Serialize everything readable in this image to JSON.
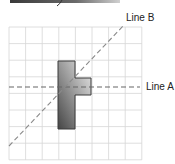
{
  "diagram": {
    "type": "grid-reflection",
    "grid": {
      "columns": 8,
      "rows": 8,
      "origin_px": [
        9,
        27
      ],
      "cell_px": 16.6,
      "line_color": "#d4d4d4"
    },
    "shape": {
      "description": "T-shaped figure (vertical bar with arm to the right)",
      "cells": [
        [
          3,
          2
        ],
        [
          3,
          3
        ],
        [
          4,
          3
        ],
        [
          3,
          4
        ],
        [
          3,
          5
        ],
        [
          3,
          6
        ]
      ],
      "fill_light": "#e8e8e8",
      "fill_dark": "#4a4a4a",
      "stroke": "#333333"
    },
    "lines": [
      {
        "id": "A",
        "label": "Line A",
        "kind": "horizontal dashed",
        "color": "#666666"
      },
      {
        "id": "B",
        "label": "Line B",
        "kind": "diagonal dashed",
        "color": "#888888"
      }
    ],
    "top_fragment": "cut-off gradient bar at top edge"
  }
}
